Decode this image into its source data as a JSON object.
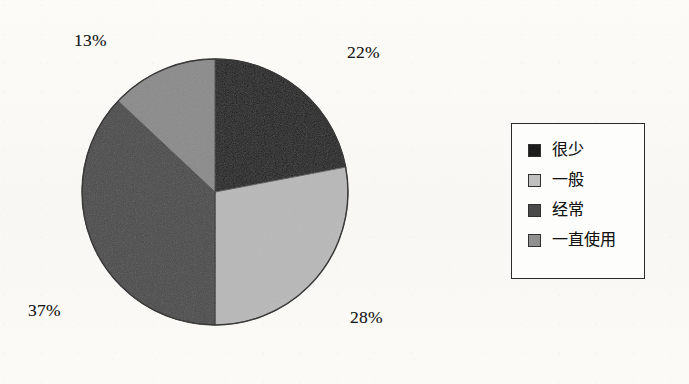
{
  "chart_data": {
    "type": "pie",
    "title": "",
    "labels": [
      "很少",
      "一般",
      "经常",
      "一直使用"
    ],
    "values": [
      22,
      28,
      37,
      13
    ],
    "value_labels": [
      "22%",
      "28%",
      "37%",
      "13%"
    ],
    "units": "percent",
    "start_angle_deg": 0,
    "direction": "clockwise",
    "colors": [
      "#1c1c1c",
      "#b8b8b8",
      "#4a4a4a",
      "#8a8a8a"
    ],
    "legend_position": "right",
    "grid": false,
    "slices": [
      {
        "label": "很少",
        "value": 22,
        "value_label": "22%",
        "color": "#1c1c1c"
      },
      {
        "label": "一般",
        "value": 28,
        "value_label": "28%",
        "color": "#b8b8b8"
      },
      {
        "label": "经常",
        "value": 37,
        "value_label": "37%",
        "color": "#4a4a4a"
      },
      {
        "label": "一直使用",
        "value": 13,
        "value_label": "13%",
        "color": "#8a8a8a"
      }
    ]
  },
  "pie": {
    "callouts": {
      "top_right": "22%",
      "bottom_right": "28%",
      "bottom_left": "37%",
      "top_left": "13%"
    }
  },
  "legend": {
    "items": [
      {
        "label": "很少",
        "color": "#1c1c1c"
      },
      {
        "label": "一般",
        "color": "#c0c0c0"
      },
      {
        "label": "经常",
        "color": "#4a4a4a"
      },
      {
        "label": "一直使用",
        "color": "#909090"
      }
    ]
  },
  "colors": {
    "background": "#fbfaf7",
    "outline": "#2a2a2a",
    "text": "#141414"
  }
}
